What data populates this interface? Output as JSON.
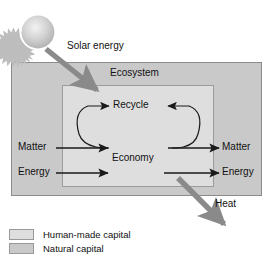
{
  "figure": {
    "type": "concept-diagram",
    "title_visible": false,
    "colors": {
      "natural_capital": "#c9c9c9",
      "human_made_capital": "#dedede",
      "arrow_thick": "#8a8a8a",
      "arrow_thin": "#1a1a1a",
      "outline": "#8c8c8c",
      "text": "#111111",
      "sun_body": "#bfbfbf",
      "sun_ring": "#ffffff",
      "background": "#ffffff"
    }
  },
  "labels": {
    "solar_energy": "Solar energy",
    "ecosystem": "Ecosystem",
    "recycle": "Recycle",
    "economy": "Economy",
    "matter_in": "Matter",
    "energy_in": "Energy",
    "matter_out": "Matter",
    "energy_out": "Energy",
    "heat": "Heat"
  },
  "legend": {
    "items": [
      {
        "label": "Human-made capital",
        "color": "#dedede",
        "swatch_name": "human-made-capital-swatch"
      },
      {
        "label": "Natural capital",
        "color": "#c9c9c9",
        "swatch_name": "natural-capital-swatch"
      }
    ]
  },
  "flows": [
    {
      "from": "Sun",
      "to": "Economy",
      "label": "Solar energy",
      "style": "thick-gray-arrow"
    },
    {
      "from": "outside",
      "to": "Economy",
      "label": "Matter",
      "style": "thin-black-arrow"
    },
    {
      "from": "outside",
      "to": "Economy",
      "label": "Energy",
      "style": "thin-black-arrow"
    },
    {
      "from": "Economy",
      "to": "outside",
      "label": "Matter",
      "style": "thin-black-arrow"
    },
    {
      "from": "Economy",
      "to": "outside",
      "label": "Energy",
      "style": "thin-black-arrow"
    },
    {
      "from": "Economy",
      "to": "Recycle",
      "label": "Recycle",
      "style": "thin-black-loop"
    },
    {
      "from": "Economy",
      "to": "environment",
      "label": "Heat",
      "style": "thick-gray-arrow"
    }
  ]
}
